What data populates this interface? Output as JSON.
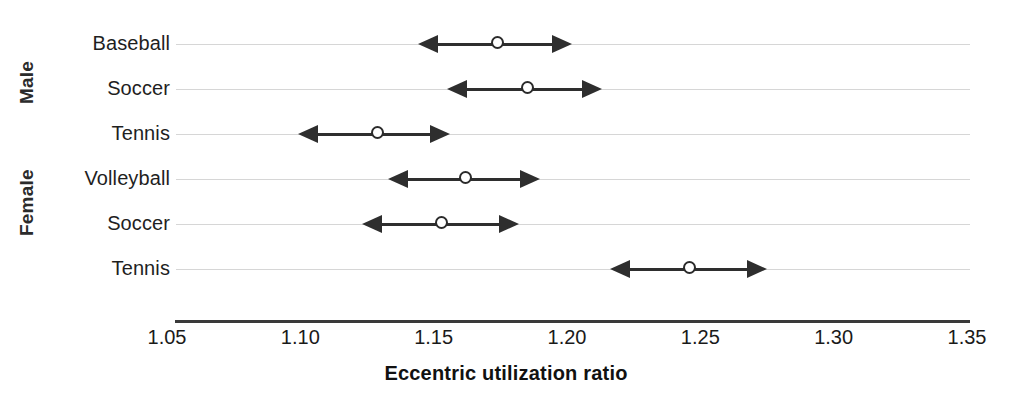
{
  "chart_data": {
    "type": "scatter",
    "title": "",
    "xlabel": "Eccentric utilization ratio",
    "ylabel": "",
    "xlim": [
      1.05,
      1.35
    ],
    "xticks": [
      "1.05",
      "1.10",
      "1.15",
      "1.20",
      "1.25",
      "1.30",
      "1.35"
    ],
    "xtick_values": [
      1.05,
      1.1,
      1.15,
      1.2,
      1.25,
      1.3,
      1.35
    ],
    "grid": true,
    "legend": "none",
    "groups": [
      {
        "name": "Male",
        "label": "Male"
      },
      {
        "name": "Female",
        "label": "Female"
      }
    ],
    "categories": [
      "Baseball",
      "Soccer",
      "Tennis",
      "Volleyball",
      "Soccer",
      "Tennis"
    ],
    "points": [
      {
        "group": "Male",
        "label": "Baseball",
        "mean": 1.174,
        "low": 1.144,
        "high": 1.202
      },
      {
        "group": "Male",
        "label": "Soccer",
        "mean": 1.185,
        "low": 1.155,
        "high": 1.213
      },
      {
        "group": "Male",
        "label": "Tennis",
        "mean": 1.129,
        "low": 1.099,
        "high": 1.156
      },
      {
        "group": "Female",
        "label": "Volleyball",
        "mean": 1.162,
        "low": 1.133,
        "high": 1.19
      },
      {
        "group": "Female",
        "label": "Soccer",
        "mean": 1.153,
        "low": 1.123,
        "high": 1.182
      },
      {
        "group": "Female",
        "label": "Tennis",
        "mean": 1.246,
        "low": 1.216,
        "high": 1.275
      }
    ],
    "marker": "open-circle",
    "series_color": "#2e2e2e",
    "grid_color": "#d6d6d6",
    "axis_color": "#3a3a3a"
  }
}
